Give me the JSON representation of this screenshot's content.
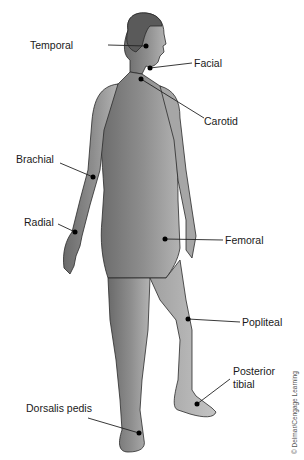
{
  "figure": {
    "credit": "© Delmar/Cengage Learning",
    "colors": {
      "skin_dark": "#6f6f6f",
      "skin_mid": "#8c8c8c",
      "skin_light": "#b5b5b5",
      "outline": "#2a2a2a",
      "marker": "#000000",
      "leader": "#222222",
      "label_text": "#1a1a1a"
    },
    "labels": [
      {
        "id": "temporal",
        "text": "Temporal",
        "x": 30,
        "y": 41
      },
      {
        "id": "facial",
        "text": "Facial",
        "x": 194,
        "y": 58
      },
      {
        "id": "carotid",
        "text": "Carotid",
        "x": 204,
        "y": 115
      },
      {
        "id": "brachial",
        "text": "Brachial",
        "x": 16,
        "y": 155
      },
      {
        "id": "radial",
        "text": "Radial",
        "x": 24,
        "y": 217
      },
      {
        "id": "femoral",
        "text": "Femoral",
        "x": 225,
        "y": 235
      },
      {
        "id": "popliteal",
        "text": "Popliteal",
        "x": 242,
        "y": 316
      },
      {
        "id": "posterior_tibial_1",
        "text": "Posterior",
        "x": 233,
        "y": 366
      },
      {
        "id": "posterior_tibial_2",
        "text": "tibial",
        "x": 233,
        "y": 379
      },
      {
        "id": "dorsalis_pedis",
        "text": "Dorsalis pedis",
        "x": 26,
        "y": 404
      }
    ]
  }
}
